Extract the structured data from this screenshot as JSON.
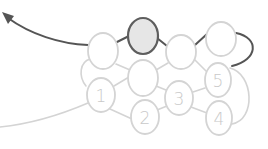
{
  "diagram": {
    "type": "beadwork-stitch-path",
    "colors": {
      "background": "#ffffff",
      "bead_outline": "#d4d4d4",
      "bead_fill": "#ffffff",
      "highlight_outline": "#5e5e5e",
      "highlight_fill": "#e6e6e6",
      "active_thread": "#555555",
      "passive_thread": "#d4d4d4",
      "label": "#c9c9c9"
    },
    "beads": [
      {
        "id": "top-left",
        "label": "",
        "cx": 103,
        "cy": 51,
        "rx": 15,
        "ry": 18,
        "highlighted": false
      },
      {
        "id": "top-highlighted",
        "label": "",
        "cx": 143,
        "cy": 36,
        "rx": 15,
        "ry": 18,
        "highlighted": true
      },
      {
        "id": "top-middle",
        "label": "",
        "cx": 181,
        "cy": 52,
        "rx": 15,
        "ry": 17,
        "highlighted": false
      },
      {
        "id": "top-right",
        "label": "",
        "cx": 221,
        "cy": 39,
        "rx": 15,
        "ry": 17,
        "highlighted": false
      },
      {
        "id": "middle-center",
        "label": "",
        "cx": 143,
        "cy": 78,
        "rx": 15,
        "ry": 18,
        "highlighted": false
      },
      {
        "id": "bead-1",
        "label": "1",
        "cx": 101,
        "cy": 95,
        "rx": 14,
        "ry": 17,
        "highlighted": false
      },
      {
        "id": "bead-2",
        "label": "2",
        "cx": 145,
        "cy": 117,
        "rx": 14,
        "ry": 17,
        "highlighted": false
      },
      {
        "id": "bead-3",
        "label": "3",
        "cx": 179,
        "cy": 98,
        "rx": 14,
        "ry": 17,
        "highlighted": false
      },
      {
        "id": "bead-5",
        "label": "5",
        "cx": 218,
        "cy": 80,
        "rx": 13,
        "ry": 17,
        "highlighted": false
      },
      {
        "id": "bead-4",
        "label": "4",
        "cx": 219,
        "cy": 118,
        "rx": 13,
        "ry": 17,
        "highlighted": false
      }
    ],
    "labels": {
      "bead_1": "1",
      "bead_2": "2",
      "bead_3": "3",
      "bead_4": "4",
      "bead_5": "5"
    }
  }
}
